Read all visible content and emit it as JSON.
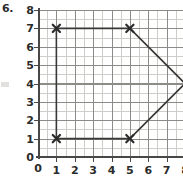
{
  "problem": {
    "number": "6."
  },
  "chart_data": {
    "type": "scatter",
    "title": "",
    "xlabel": "",
    "ylabel": "",
    "xlim": [
      0,
      8
    ],
    "ylim": [
      0,
      8
    ],
    "grid": true,
    "minor_grid_step": 0.5,
    "major_grid_step": 1,
    "legend": "none",
    "x_ticks": [
      "0",
      "1",
      "2",
      "3",
      "4",
      "5",
      "6",
      "7",
      "8"
    ],
    "y_ticks": [
      "0",
      "1",
      "2",
      "3",
      "4",
      "5",
      "6",
      "7",
      "8"
    ],
    "origin_label": "0",
    "series": [
      {
        "name": "polygon",
        "closed": true,
        "marker": "x",
        "points": [
          {
            "x": 1,
            "y": 7,
            "marked": true
          },
          {
            "x": 5,
            "y": 7,
            "marked": true
          },
          {
            "x": 8,
            "y": 4,
            "marked": false
          },
          {
            "x": 5,
            "y": 1,
            "marked": true
          },
          {
            "x": 1,
            "y": 1,
            "marked": true
          }
        ]
      }
    ],
    "colors": {
      "line": "#3a3836",
      "marker": "#2b2b2b",
      "grid_major": "#8d8b88",
      "grid_minor": "#cfcdca",
      "axis": "#4a4846",
      "background": "#ffffff"
    }
  }
}
